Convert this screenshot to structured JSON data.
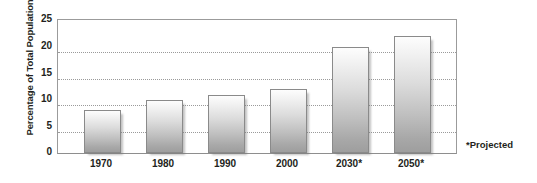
{
  "chart_data": {
    "type": "bar",
    "title": "",
    "xlabel": "",
    "ylabel": "Percentage of Total Population",
    "categories": [
      "1970",
      "1980",
      "1990",
      "2000",
      "2030*",
      "2050*"
    ],
    "values": [
      8,
      10,
      11,
      12,
      20,
      22
    ],
    "ylim": [
      0,
      25
    ],
    "ytick_labels": [
      "0",
      "5",
      "10",
      "15",
      "20",
      "25"
    ],
    "ytick_values": [
      0,
      5,
      10,
      15,
      20,
      25
    ],
    "grid": true,
    "gridlines_at": [
      5,
      10,
      15,
      20
    ],
    "legend": "none",
    "annotations": [
      {
        "name": "projected-note",
        "text": "*Projected"
      }
    ],
    "colors": {
      "bar_fill_top": "#fdfdfd",
      "bar_fill_bottom": "#9e9e9e",
      "bar_border": "#8a8a8a",
      "axis": "#9b9b9b",
      "gridline": "#9a9a9a",
      "text": "#231f20",
      "background": "#ffffff"
    }
  },
  "footnote": {
    "text": "*Projected"
  }
}
